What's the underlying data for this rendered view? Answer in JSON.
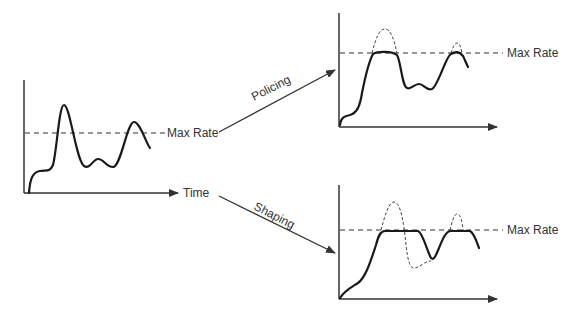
{
  "diagram": {
    "labels": {
      "max_rate_left": "Max Rate",
      "time": "Time",
      "policing": "Policing",
      "shaping": "Shaping",
      "max_rate_policing": "Max Rate",
      "max_rate_shaping": "Max Rate"
    },
    "panels": [
      {
        "id": "original",
        "description": "Original traffic rate over time with bursts above max rate"
      },
      {
        "id": "policing",
        "description": "Policed traffic: bursts above max rate are clipped (dropped)"
      },
      {
        "id": "shaping",
        "description": "Shaped traffic: bursts above max rate are buffered and delayed"
      }
    ],
    "colors": {
      "line": "#1a1a1a",
      "axis": "#333333",
      "background": "#ffffff"
    }
  }
}
